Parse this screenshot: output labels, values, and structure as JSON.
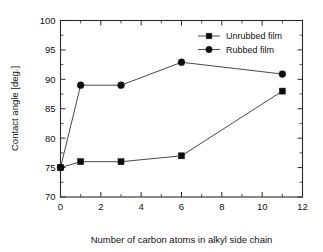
{
  "chart_data": {
    "type": "line",
    "title": "",
    "subtitle": "",
    "xlabel": "Number of carbon atoms in alkyl side chain",
    "ylabel": "Contact angle [deg.]",
    "xlim": [
      0,
      12
    ],
    "ylim": [
      70,
      100
    ],
    "xticks": [
      0,
      2,
      4,
      6,
      8,
      10,
      12
    ],
    "xticklabels": [
      "0",
      "2",
      "4",
      "6",
      "8",
      "10",
      "12"
    ],
    "xminorticks": [
      1,
      3,
      5,
      7,
      9,
      11
    ],
    "yticks": [
      70,
      75,
      80,
      85,
      90,
      95,
      100
    ],
    "yticklabels": [
      "70",
      "75",
      "80",
      "85",
      "90",
      "95",
      "100"
    ],
    "yminorticks": [
      72.5,
      77.5,
      82.5,
      87.5,
      92.5,
      97.5
    ],
    "grid": false,
    "legend_position": "top-right",
    "x": [
      0,
      1,
      3,
      6,
      11
    ],
    "series": [
      {
        "name": "Unrubbed film",
        "marker": "square",
        "color": "#0d0d0d",
        "x": [
          0,
          1,
          3,
          6,
          11
        ],
        "values": [
          75,
          76,
          76,
          77,
          88
        ]
      },
      {
        "name": "Rubbed film",
        "marker": "circle",
        "color": "#0d0d0d",
        "x": [
          0,
          1,
          3,
          6,
          11
        ],
        "values": [
          75,
          89,
          89,
          92.9,
          90.9
        ]
      }
    ],
    "annotations": []
  },
  "legend": {
    "entries": [
      {
        "label": "Unrubbed film",
        "marker": "square"
      },
      {
        "label": "Rubbed film",
        "marker": "circle"
      }
    ]
  },
  "axes": {
    "x_axis_label": "Number of carbon atoms in alkyl side chain",
    "y_axis_label": "Contact angle [deg.]"
  }
}
